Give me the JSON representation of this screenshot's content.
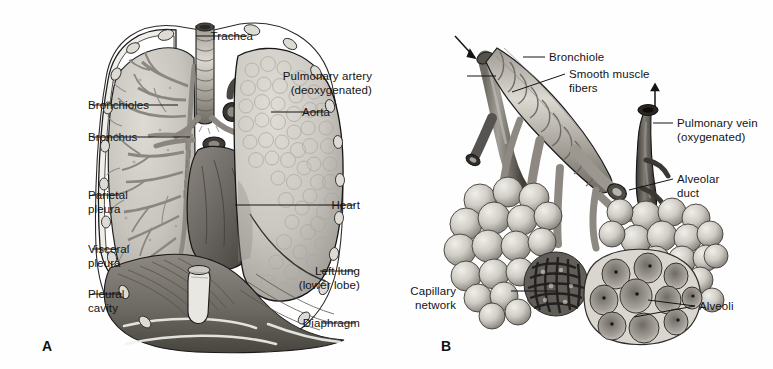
{
  "figure": {
    "type": "anatomical-illustration",
    "title": "",
    "background_color": "#fefefe",
    "ink_color": "#141414"
  },
  "panels": [
    {
      "id": "A",
      "letter": "A",
      "subject": "Thoracic cavity with lungs, heart, trachea and diaphragm",
      "labels": [
        {
          "id": "trachea",
          "text": "Trachea",
          "text2": "",
          "side": "right",
          "x": 253,
          "y": 30,
          "leader": [
            [
              247,
              36
            ],
            [
              196,
              36
            ]
          ]
        },
        {
          "id": "aorta",
          "text": "Aorta",
          "text2": "",
          "side": "right",
          "x": 330,
          "y": 106,
          "leader": [
            [
              325,
              112
            ],
            [
              271,
              112
            ]
          ]
        },
        {
          "id": "heart",
          "text": "Heart",
          "text2": "",
          "side": "right",
          "x": 360,
          "y": 199,
          "leader": [
            [
              355,
              205
            ],
            [
              235,
              205
            ]
          ]
        },
        {
          "id": "left-lung",
          "text": "Left lung",
          "text2": "(lower lobe)",
          "side": "right",
          "x": 360,
          "y": 265,
          "leader": [
            [
              355,
              271
            ],
            [
              320,
              271
            ]
          ]
        },
        {
          "id": "diaphragm",
          "text": "Diaphragm",
          "text2": "",
          "side": "right",
          "x": 360,
          "y": 317,
          "leader": [
            [
              355,
              323
            ],
            [
              322,
              323
            ]
          ]
        },
        {
          "id": "bronchioles",
          "text": "Bronchioles",
          "text2": "",
          "side": "left",
          "x": 88,
          "y": 99,
          "leader": [
            [
              92,
              105
            ],
            [
              178,
              105
            ]
          ]
        },
        {
          "id": "bronchus",
          "text": "Bronchus",
          "text2": "",
          "side": "left",
          "x": 88,
          "y": 131,
          "leader": [
            [
              92,
              137
            ],
            [
              190,
              137
            ]
          ]
        },
        {
          "id": "parietal-pleura",
          "text": "Parietal",
          "text2": "pleura",
          "side": "left",
          "x": 88,
          "y": 189,
          "leader": [
            [
              92,
              195
            ],
            [
              120,
              195
            ]
          ]
        },
        {
          "id": "visceral-pleura",
          "text": "Visceral",
          "text2": "pleura",
          "side": "left",
          "x": 88,
          "y": 243,
          "leader": [
            [
              92,
              249
            ],
            [
              118,
              249
            ]
          ]
        },
        {
          "id": "pleural-cavity",
          "text": "Pleural",
          "text2": "cavity",
          "side": "left",
          "x": 88,
          "y": 288,
          "leader": [
            [
              92,
              294
            ],
            [
              122,
              294
            ]
          ]
        }
      ],
      "letter_pos": {
        "x": 42,
        "y": 338
      }
    },
    {
      "id": "B",
      "letter": "B",
      "subject": "Bronchiole with alveolar sacs, pulmonary artery and vein, capillary network",
      "labels": [
        {
          "id": "bronchiole",
          "text": "Bronchiole",
          "text2": "",
          "side": "left",
          "x": 549,
          "y": 51,
          "leader": [
            [
              545,
              57
            ],
            [
              523,
              57
            ]
          ]
        },
        {
          "id": "smooth-muscle-fibers",
          "text": "Smooth muscle",
          "text2": "fibers",
          "side": "left",
          "x": 569,
          "y": 68,
          "leader": [
            [
              565,
              74
            ],
            [
              512,
              92
            ]
          ]
        },
        {
          "id": "pulmonary-artery",
          "text": "Pulmonary artery",
          "text2": "(deoxygenated)",
          "side": "right",
          "x": 372,
          "y": 70,
          "leader": [
            [
              467,
              76
            ],
            [
              496,
              76
            ]
          ]
        },
        {
          "id": "pulmonary-vein",
          "text": "Pulmonary vein",
          "text2": "(oxygenated)",
          "side": "left",
          "x": 677,
          "y": 117,
          "leader": [
            [
              673,
              123
            ],
            [
              653,
              123
            ]
          ]
        },
        {
          "id": "alveolar-duct",
          "text": "Alveolar",
          "text2": "duct",
          "side": "left",
          "x": 677,
          "y": 173,
          "leader": [
            [
              673,
              179
            ],
            [
              629,
              190
            ]
          ]
        },
        {
          "id": "capillary-network",
          "text": "Capillary",
          "text2": "network",
          "side": "right",
          "x": 456,
          "y": 285,
          "leader": [
            [
              511,
              291
            ],
            [
              556,
              291
            ]
          ]
        },
        {
          "id": "alveoli",
          "text": "Alveoli",
          "text2": "",
          "side": "left",
          "x": 699,
          "y": 300,
          "leader": [
            [
              695,
              306
            ],
            [
              648,
              300
            ]
          ]
        },
        {
          "id": "alveoli-2",
          "text": "",
          "text2": "",
          "side": "left",
          "x": 0,
          "y": 0,
          "leader": [
            [
              695,
              306
            ],
            [
              634,
              317
            ]
          ]
        }
      ],
      "letter_pos": {
        "x": 441,
        "y": 338
      }
    }
  ],
  "anatomy_colors": {
    "lung_tissue": "#c9c6bf",
    "lung_cut_surface": "#bcb9b2",
    "heart_muscle": "#6e6a66",
    "diaphragm": "#7d7872",
    "cartilage": "#d8d5ce",
    "bronchial_tree": "#8a867f",
    "vessel_dark": "#4a4742",
    "alveoli_light": "#d5d2cb",
    "capillary_dark": "#3f3c38",
    "outline": "#1c1c1c"
  }
}
